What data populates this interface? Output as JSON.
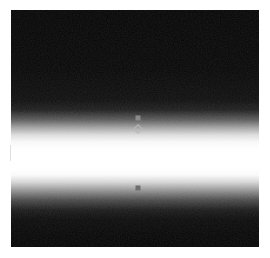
{
  "figure": {
    "width": 270,
    "height": 258,
    "background_color": "#ffffff",
    "caption": "",
    "caption_color": "#e6e6e6"
  },
  "plot_area": {
    "name": "raster-panel",
    "left": 11,
    "top": 10,
    "width": 248,
    "height": 237,
    "base_color": "#000000",
    "band_color": "#ffffff"
  },
  "chart_data": {
    "type": "heatmap",
    "title": "",
    "subtitle": "",
    "xlabel": "",
    "ylabel": "",
    "grid": false,
    "legend": false,
    "colormap": "grayscale",
    "colormap_low": "#000000",
    "colormap_high": "#ffffff",
    "x": [
      0,
      248
    ],
    "xlim": [
      0,
      248
    ],
    "ylim": [
      0,
      237
    ],
    "vertical_profile": {
      "ylabel": "row (px from panel top)",
      "xlabel": "intensity (0-255)",
      "rows": [
        0,
        60,
        90,
        100,
        110,
        118,
        125,
        132,
        140,
        150,
        158,
        165,
        172,
        180,
        190,
        200,
        210,
        225,
        237
      ],
      "intensities": [
        4,
        6,
        14,
        30,
        92,
        165,
        220,
        248,
        255,
        255,
        255,
        250,
        214,
        150,
        74,
        26,
        10,
        5,
        4
      ]
    },
    "band": {
      "center_row": 140,
      "core_top_row": 125,
      "core_bottom_row": 158,
      "upper_falloff_rows": [
        90,
        125
      ],
      "lower_falloff_rows": [
        158,
        195
      ],
      "peak_intensity": 255,
      "floor_intensity": 4
    },
    "markers": [
      {
        "name": "marker-upper-square",
        "style": "filled-square",
        "color": "#8a8a8a",
        "x_px": 127,
        "y_px": 108,
        "size_px": 5
      },
      {
        "name": "marker-open-diamond",
        "style": "open-diamond",
        "color": "#b8b8b8",
        "x_px": 127,
        "y_px": 119,
        "size_px": 7
      },
      {
        "name": "marker-lower-square",
        "style": "filled-square",
        "color": "#6e6e6e",
        "x_px": 127,
        "y_px": 178,
        "size_px": 5
      }
    ],
    "annotations": [
      {
        "name": "left-margin-tick",
        "x_px": 10,
        "y_px": 145,
        "length_px": 16,
        "color": "#dedede"
      }
    ]
  }
}
